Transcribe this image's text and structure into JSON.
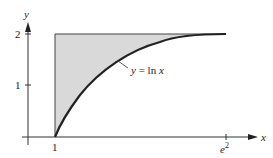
{
  "figure": {
    "type": "area-between-curves",
    "axes": {
      "x_label": "x",
      "y_label": "y",
      "x_ticks": [
        {
          "value": 1,
          "label": "1"
        },
        {
          "value": 7.389,
          "label": "e",
          "label_sup": "2"
        }
      ],
      "y_ticks": [
        {
          "value": 1,
          "label": "1"
        },
        {
          "value": 2,
          "label": "2"
        }
      ]
    },
    "curve": {
      "equation_label": "y = ln x",
      "label_lhs": "y",
      "label_eq": " = ",
      "label_fn": "ln",
      "label_var": "x",
      "domain": [
        1,
        7.389
      ]
    },
    "shaded_region": {
      "description": "Region bounded by x = 1, y = 2, and y = ln x",
      "fill_color": "#d9d9d9"
    },
    "colors": {
      "curve": "#222222",
      "axes": "#333333",
      "shade": "#d9d9d9"
    }
  }
}
